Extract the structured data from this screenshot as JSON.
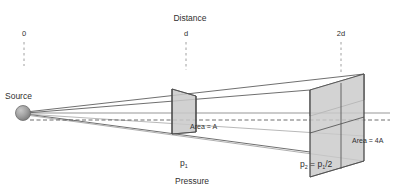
{
  "figure": {
    "title_top": "Distance",
    "title_bottom": "Pressure",
    "source_label": "Source",
    "ticks": [
      {
        "label": "0",
        "x": 24
      },
      {
        "label": "d",
        "x": 186
      },
      {
        "label": "2d",
        "x": 341
      }
    ],
    "annotations": {
      "area_near": "Area = A",
      "area_far": "Area = 4A",
      "pressure_near_base": "p",
      "pressure_near_sub": "1",
      "pressure_far_base": "p",
      "pressure_far_sub": "2",
      "pressure_far_eq_base": "p",
      "pressure_far_eq_sub": "1",
      "pressure_far_eq_tail": "/2",
      "equals": " = "
    },
    "colors": {
      "line": "#4a4a4a",
      "line_light": "#9a9a9a",
      "panel_fill": "#c9c9c9",
      "panel_fill_light": "#d8d8d8",
      "sphere_dark": "#8a8a8a",
      "sphere_light": "#c0c0c0",
      "text": "#303030",
      "dash": "#a0a0a0",
      "background": "#ffffff"
    }
  }
}
